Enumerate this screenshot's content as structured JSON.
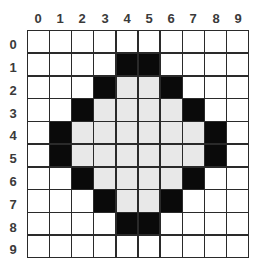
{
  "columns": [
    "0",
    "1",
    "2",
    "3",
    "4",
    "5",
    "6",
    "7",
    "8",
    "9"
  ],
  "rows": [
    "0",
    "1",
    "2",
    "3",
    "4",
    "5",
    "6",
    "7",
    "8",
    "9"
  ],
  "legend": {
    "0": "white",
    "1": "black",
    "2": "light-gray"
  },
  "colors": {
    "white": "#ffffff",
    "black": "#0a0a0a",
    "light-gray": "#e8e8e8",
    "grid-line": "#2a2a2a",
    "label": "#3a3a3a"
  },
  "cells": [
    [
      0,
      0,
      0,
      0,
      0,
      0,
      0,
      0,
      0,
      0
    ],
    [
      0,
      0,
      0,
      0,
      1,
      1,
      0,
      0,
      0,
      0
    ],
    [
      0,
      0,
      0,
      1,
      2,
      2,
      1,
      0,
      0,
      0
    ],
    [
      0,
      0,
      1,
      2,
      2,
      2,
      2,
      1,
      0,
      0
    ],
    [
      0,
      1,
      2,
      2,
      2,
      2,
      2,
      2,
      1,
      0
    ],
    [
      0,
      1,
      2,
      2,
      2,
      2,
      2,
      2,
      1,
      0
    ],
    [
      0,
      0,
      1,
      2,
      2,
      2,
      2,
      1,
      0,
      0
    ],
    [
      0,
      0,
      0,
      1,
      2,
      2,
      1,
      0,
      0,
      0
    ],
    [
      0,
      0,
      0,
      0,
      1,
      1,
      0,
      0,
      0,
      0
    ],
    [
      0,
      0,
      0,
      0,
      0,
      0,
      0,
      0,
      0,
      0
    ]
  ]
}
